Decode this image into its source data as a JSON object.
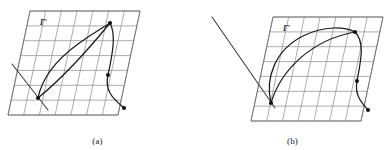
{
  "figure": {
    "type": "diagram",
    "background_color": "#ffffff",
    "grid_line_color": "#8a8a8a",
    "curve_color": "#1c1c1c",
    "ray_color": "#3a3a3a",
    "dot_color": "#111111",
    "panels": [
      {
        "id": "a",
        "caption": "(a)",
        "surface_label": "Γ′",
        "surface_label_position": {
          "x": 44,
          "y": 22
        },
        "grid": {
          "shape": "parallelogram",
          "corners": [
            {
              "x": 30,
              "y": 11
            },
            {
              "x": 140,
              "y": 11
            },
            {
              "x": 118,
              "y": 115
            },
            {
              "x": 8,
              "y": 115
            }
          ],
          "rows": 7,
          "cols": 7,
          "shear": "left-leaning"
        },
        "curves": [
          {
            "name": "curve-left-loop",
            "path": "M 38 98 C 42 78, 56 60, 78 44 C 96 31, 106 26, 110 23"
          },
          {
            "name": "curve-right-s",
            "path": "M 110 23 C 116 34, 113 52, 108 75 C 104 92, 115 100, 124 108"
          },
          {
            "name": "curve-chord",
            "path": "M 38 98 C 60 80, 88 50, 110 23"
          }
        ],
        "rays": [
          {
            "name": "incoming-ray",
            "path": "M 12 64 L 48 110"
          }
        ],
        "dots": [
          {
            "name": "node-top",
            "x": 110,
            "y": 23,
            "r": 2.1
          },
          {
            "name": "node-left",
            "x": 38,
            "y": 98,
            "r": 2.1
          },
          {
            "name": "node-middle",
            "x": 108,
            "y": 75,
            "r": 2.0
          },
          {
            "name": "node-bottom-right",
            "x": 124,
            "y": 108,
            "r": 2.0
          }
        ]
      },
      {
        "id": "b",
        "caption": "(b)",
        "surface_label": "Γ′",
        "surface_label_position": {
          "x": 82,
          "y": 26
        },
        "grid": {
          "shape": "parallelogram",
          "corners": [
            {
              "x": 78,
              "y": 17
            },
            {
              "x": 188,
              "y": 17
            },
            {
              "x": 166,
              "y": 121
            },
            {
              "x": 56,
              "y": 121
            }
          ],
          "rows": 7,
          "cols": 7,
          "shear": "left-leaning"
        },
        "curves": [
          {
            "name": "curve-arc-top",
            "path": "M 76 103 C 70 78, 80 50, 108 36 C 130 25, 150 27, 160 32"
          },
          {
            "name": "curve-right-s",
            "path": "M 160 32 C 170 42, 166 60, 162 81 C 159 96, 168 104, 173 110"
          },
          {
            "name": "curve-inner-chord",
            "path": "M 76 103 C 86 70, 116 40, 160 32"
          }
        ],
        "rays": [
          {
            "name": "incoming-ray",
            "path": "M 17 17 L 80 108"
          }
        ],
        "dots": [
          {
            "name": "node-top-right",
            "x": 160,
            "y": 32,
            "r": 2.1
          },
          {
            "name": "node-left",
            "x": 76,
            "y": 103,
            "r": 2.1
          },
          {
            "name": "node-middle",
            "x": 162,
            "y": 81,
            "r": 2.0
          },
          {
            "name": "node-bottom-right",
            "x": 173,
            "y": 110,
            "r": 2.0
          }
        ]
      }
    ]
  }
}
